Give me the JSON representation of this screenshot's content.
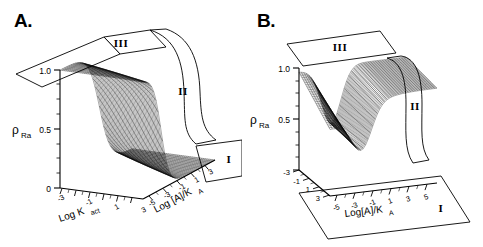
{
  "figure": {
    "background": "#ffffff",
    "line_color": "#000000",
    "panels": [
      {
        "id": "A",
        "letter": "A.",
        "y_axis": {
          "label_main": "ρ",
          "label_sub": "Ra",
          "ticks": [
            "1.0",
            "0.5",
            "0"
          ],
          "range": [
            0,
            1
          ]
        },
        "depth_axis": {
          "label_main": "Log K",
          "label_sub": "act",
          "ticks": [
            "-3",
            "-1",
            "1",
            "3"
          ],
          "range": [
            -3,
            3
          ]
        },
        "x_axis": {
          "label_main": "Log [A]/K",
          "label_sub": "A",
          "ticks": [
            "-5",
            "-3",
            "-1",
            "1",
            "3"
          ],
          "range": [
            -5,
            5
          ]
        },
        "regions": [
          {
            "name": "I",
            "shape": "parallelogram-floor"
          },
          {
            "name": "II",
            "shape": "curved-band-right"
          },
          {
            "name": "III",
            "shape": "parallelogram-top"
          }
        ]
      },
      {
        "id": "B",
        "letter": "B.",
        "y_axis": {
          "label_main": "ρ",
          "label_sub": "Ra",
          "ticks": [
            "1.0",
            "0.5"
          ],
          "range": [
            0,
            1
          ]
        },
        "depth_axis": {
          "label_main": "",
          "label_sub": "",
          "ticks": [
            "-3",
            "-1",
            "1",
            "3"
          ],
          "range": [
            -3,
            3
          ]
        },
        "x_axis": {
          "label_main": "Log[A]/K",
          "label_sub": "A",
          "ticks": [
            "-5",
            "-3",
            "-1",
            "1",
            "3",
            "5"
          ],
          "range": [
            -5,
            5
          ]
        },
        "regions": [
          {
            "name": "I",
            "shape": "parallelogram-floor"
          },
          {
            "name": "II",
            "shape": "curved-band-right"
          },
          {
            "name": "III",
            "shape": "parallelogram-top"
          }
        ]
      }
    ]
  },
  "chart_data": [
    {
      "type": "surface",
      "panel": "A",
      "title": "",
      "xlabel": "Log K_act",
      "ylabel": "Log [A]/K_A",
      "zlabel": "rho_Ra",
      "xlim": [
        -3,
        3
      ],
      "ylim": [
        -5,
        5
      ],
      "zlim": [
        0,
        1
      ],
      "xticks": [
        -3,
        -1,
        1,
        3
      ],
      "yticks": [
        -5,
        -3,
        -1,
        1,
        3
      ],
      "zticks": [
        0,
        0.5,
        1.0
      ],
      "grid": false,
      "legend": "none",
      "description": "Sigmoidal surface of receptor activation fraction rho_Ra falling from 1.0 plateau to 0 plateau; dense black wireframe mesh.",
      "surface_z": [
        [
          1.0,
          1.0,
          1.0,
          0.99,
          0.97,
          0.9,
          0.7,
          0.4,
          0.18,
          0.07,
          0.03
        ],
        [
          1.0,
          1.0,
          1.0,
          0.99,
          0.96,
          0.88,
          0.66,
          0.36,
          0.15,
          0.06,
          0.02
        ],
        [
          1.0,
          1.0,
          0.99,
          0.98,
          0.95,
          0.85,
          0.61,
          0.31,
          0.12,
          0.04,
          0.02
        ],
        [
          1.0,
          1.0,
          0.99,
          0.98,
          0.93,
          0.81,
          0.55,
          0.26,
          0.09,
          0.03,
          0.01
        ],
        [
          1.0,
          0.99,
          0.99,
          0.97,
          0.91,
          0.76,
          0.48,
          0.2,
          0.07,
          0.02,
          0.01
        ],
        [
          1.0,
          0.99,
          0.98,
          0.96,
          0.88,
          0.7,
          0.4,
          0.15,
          0.05,
          0.02,
          0.01
        ],
        [
          0.99,
          0.99,
          0.98,
          0.94,
          0.84,
          0.62,
          0.32,
          0.11,
          0.03,
          0.01,
          0.0
        ],
        [
          0.99,
          0.98,
          0.97,
          0.92,
          0.79,
          0.53,
          0.24,
          0.07,
          0.02,
          0.01,
          0.0
        ],
        [
          0.99,
          0.98,
          0.96,
          0.89,
          0.72,
          0.44,
          0.17,
          0.05,
          0.01,
          0.0,
          0.0
        ],
        [
          0.98,
          0.97,
          0.94,
          0.85,
          0.64,
          0.35,
          0.12,
          0.03,
          0.01,
          0.0,
          0.0
        ],
        [
          0.98,
          0.96,
          0.92,
          0.8,
          0.55,
          0.27,
          0.08,
          0.02,
          0.0,
          0.0,
          0.0
        ]
      ],
      "surface_x": [
        -3,
        -2.4,
        -1.8,
        -1.2,
        -0.6,
        0,
        0.6,
        1.2,
        1.8,
        2.4,
        3
      ],
      "surface_y": [
        -5,
        -4,
        -3,
        -2,
        -1,
        0,
        1,
        2,
        3,
        4,
        5
      ]
    },
    {
      "type": "surface",
      "panel": "B",
      "title": "",
      "xlabel": "",
      "ylabel": "Log[A]/K_A",
      "zlabel": "rho_Ra",
      "xlim": [
        -3,
        3
      ],
      "ylim": [
        -5,
        5
      ],
      "zlim": [
        0,
        1
      ],
      "xticks": [
        -3,
        -1,
        1,
        3
      ],
      "yticks": [
        -5,
        -3,
        -1,
        1,
        3,
        5
      ],
      "zticks": [
        0.5,
        1.0
      ],
      "grid": false,
      "legend": "none",
      "description": "Surface with narrow sharp trough/drop near low ligand concentration then broad high plateau; dense black wireframe mesh.",
      "surface_z": [
        [
          1.0,
          0.98,
          0.8,
          0.55,
          0.62,
          0.75,
          0.84,
          0.89,
          0.92,
          0.94,
          0.95
        ],
        [
          1.0,
          0.97,
          0.76,
          0.49,
          0.57,
          0.71,
          0.81,
          0.87,
          0.9,
          0.92,
          0.93
        ],
        [
          1.0,
          0.96,
          0.71,
          0.43,
          0.52,
          0.67,
          0.78,
          0.84,
          0.88,
          0.9,
          0.91
        ],
        [
          0.99,
          0.95,
          0.66,
          0.37,
          0.46,
          0.62,
          0.74,
          0.81,
          0.85,
          0.88,
          0.89
        ],
        [
          0.99,
          0.93,
          0.6,
          0.31,
          0.4,
          0.56,
          0.69,
          0.77,
          0.82,
          0.85,
          0.87
        ],
        [
          0.99,
          0.91,
          0.53,
          0.26,
          0.34,
          0.5,
          0.64,
          0.73,
          0.79,
          0.82,
          0.84
        ],
        [
          0.98,
          0.88,
          0.46,
          0.21,
          0.28,
          0.44,
          0.58,
          0.68,
          0.75,
          0.79,
          0.81
        ],
        [
          0.98,
          0.85,
          0.39,
          0.17,
          0.23,
          0.37,
          0.52,
          0.63,
          0.7,
          0.75,
          0.78
        ],
        [
          0.97,
          0.81,
          0.32,
          0.13,
          0.18,
          0.31,
          0.45,
          0.57,
          0.65,
          0.7,
          0.74
        ],
        [
          0.96,
          0.76,
          0.26,
          0.1,
          0.14,
          0.25,
          0.38,
          0.5,
          0.59,
          0.65,
          0.69
        ],
        [
          0.95,
          0.7,
          0.2,
          0.07,
          0.1,
          0.19,
          0.31,
          0.43,
          0.52,
          0.59,
          0.63
        ]
      ],
      "surface_x": [
        -3,
        -2.4,
        -1.8,
        -1.2,
        -0.6,
        0,
        0.6,
        1.2,
        1.8,
        2.4,
        3
      ],
      "surface_y": [
        -5,
        -4,
        -3,
        -2,
        -1,
        0,
        1,
        2,
        3,
        4,
        5
      ]
    }
  ]
}
